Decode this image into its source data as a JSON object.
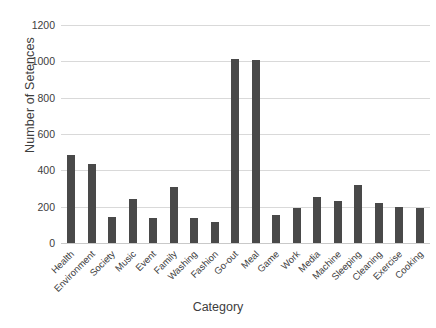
{
  "chart_data": {
    "type": "bar",
    "title": "",
    "xlabel": "Category",
    "ylabel": "Number of Setences",
    "categories": [
      "Health",
      "Environment",
      "Society",
      "Music",
      "Event",
      "Family",
      "Washing",
      "Fashion",
      "Go-out",
      "Meal",
      "Game",
      "Work",
      "Media",
      "Machine",
      "Sleeping",
      "Cleaning",
      "Exercise",
      "Cooking"
    ],
    "values": [
      485,
      435,
      145,
      245,
      135,
      310,
      135,
      115,
      1015,
      1005,
      155,
      195,
      255,
      230,
      320,
      220,
      200,
      190
    ],
    "ylim": [
      0,
      1200
    ],
    "ytick_labels": [
      "1200",
      "1000",
      "800",
      "600",
      "400",
      "200",
      "0"
    ],
    "ytick_values": [
      1200,
      1000,
      800,
      600,
      400,
      200,
      0
    ],
    "grid": true,
    "legend": false,
    "bar_color": "#494949",
    "grid_color": "#d9d9d9",
    "background_color": "#ffffff"
  }
}
